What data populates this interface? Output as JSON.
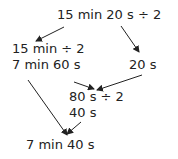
{
  "diagram": {
    "nodes": {
      "top": "15 min 20 s ÷ 2",
      "left_line1": "15 min ÷ 2",
      "left_line2": "7 min 60 s",
      "right": "20 s",
      "middle_line1": "80 s ÷ 2",
      "middle_line2": "40 s",
      "bottom": "7 min 40 s"
    },
    "colors": {
      "text": "#222222",
      "arrow": "#222222"
    }
  }
}
